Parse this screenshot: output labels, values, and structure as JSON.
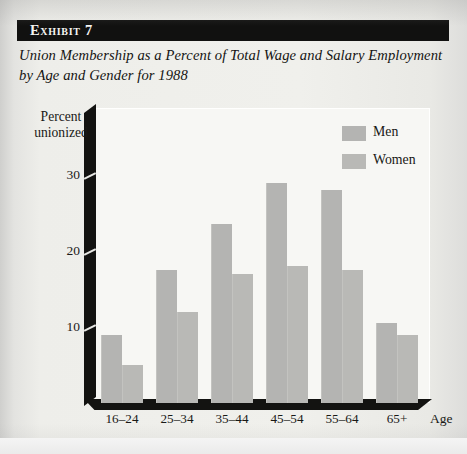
{
  "exhibit": {
    "label": "Exhibit 7",
    "title": "Union Membership as a Percent of Total Wage and Salary Employment by Age and Gender for 1988"
  },
  "legend": {
    "items": [
      {
        "name": "Men",
        "color": "#b4b4b2"
      },
      {
        "name": "Women",
        "color": "#b9b9b6"
      }
    ]
  },
  "axes": {
    "ylabel_line1": "Percent",
    "ylabel_line2": "unionized",
    "xlabel": "Age",
    "yticks": [
      "10",
      "20",
      "30"
    ]
  },
  "chart_data": {
    "type": "bar",
    "title": "Union Membership as a Percent of Total Wage and Salary Employment by Age and Gender for 1988",
    "xlabel": "Age",
    "ylabel": "Percent unionized",
    "categories": [
      "16–24",
      "25–34",
      "35–44",
      "45–54",
      "55–64",
      "65+"
    ],
    "series": [
      {
        "name": "Men",
        "values": [
          9,
          17.5,
          23.5,
          29,
          28,
          10.5
        ]
      },
      {
        "name": "Women",
        "values": [
          5,
          12,
          17,
          18,
          17.5,
          9
        ]
      }
    ],
    "ylim": [
      0,
      33
    ],
    "ytick_values": [
      10,
      20,
      30
    ],
    "grid": false,
    "legend_position": "top-right"
  }
}
